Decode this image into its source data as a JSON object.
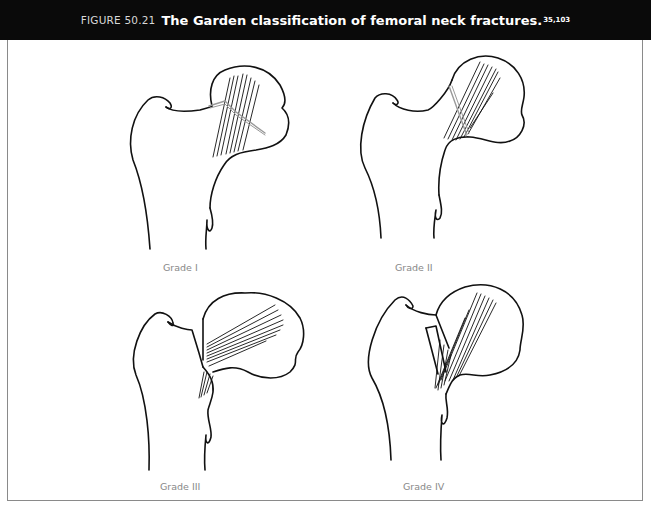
{
  "figure": {
    "number": "FIGURE 50.21",
    "caption": "The Garden classification of femoral neck fractures.",
    "references": "35,103"
  },
  "panels": [
    {
      "label": "Grade I",
      "position": "top-left"
    },
    {
      "label": "Grade II",
      "position": "top-right"
    },
    {
      "label": "Grade III",
      "position": "bottom-left"
    },
    {
      "label": "Grade IV",
      "position": "bottom-right"
    }
  ],
  "colors": {
    "header_bg": "#0a0a0a",
    "header_text": "#ffffff",
    "line": "#111111",
    "fracture_line": "#999999",
    "label": "#888888",
    "frame": "#8a8a8a"
  }
}
